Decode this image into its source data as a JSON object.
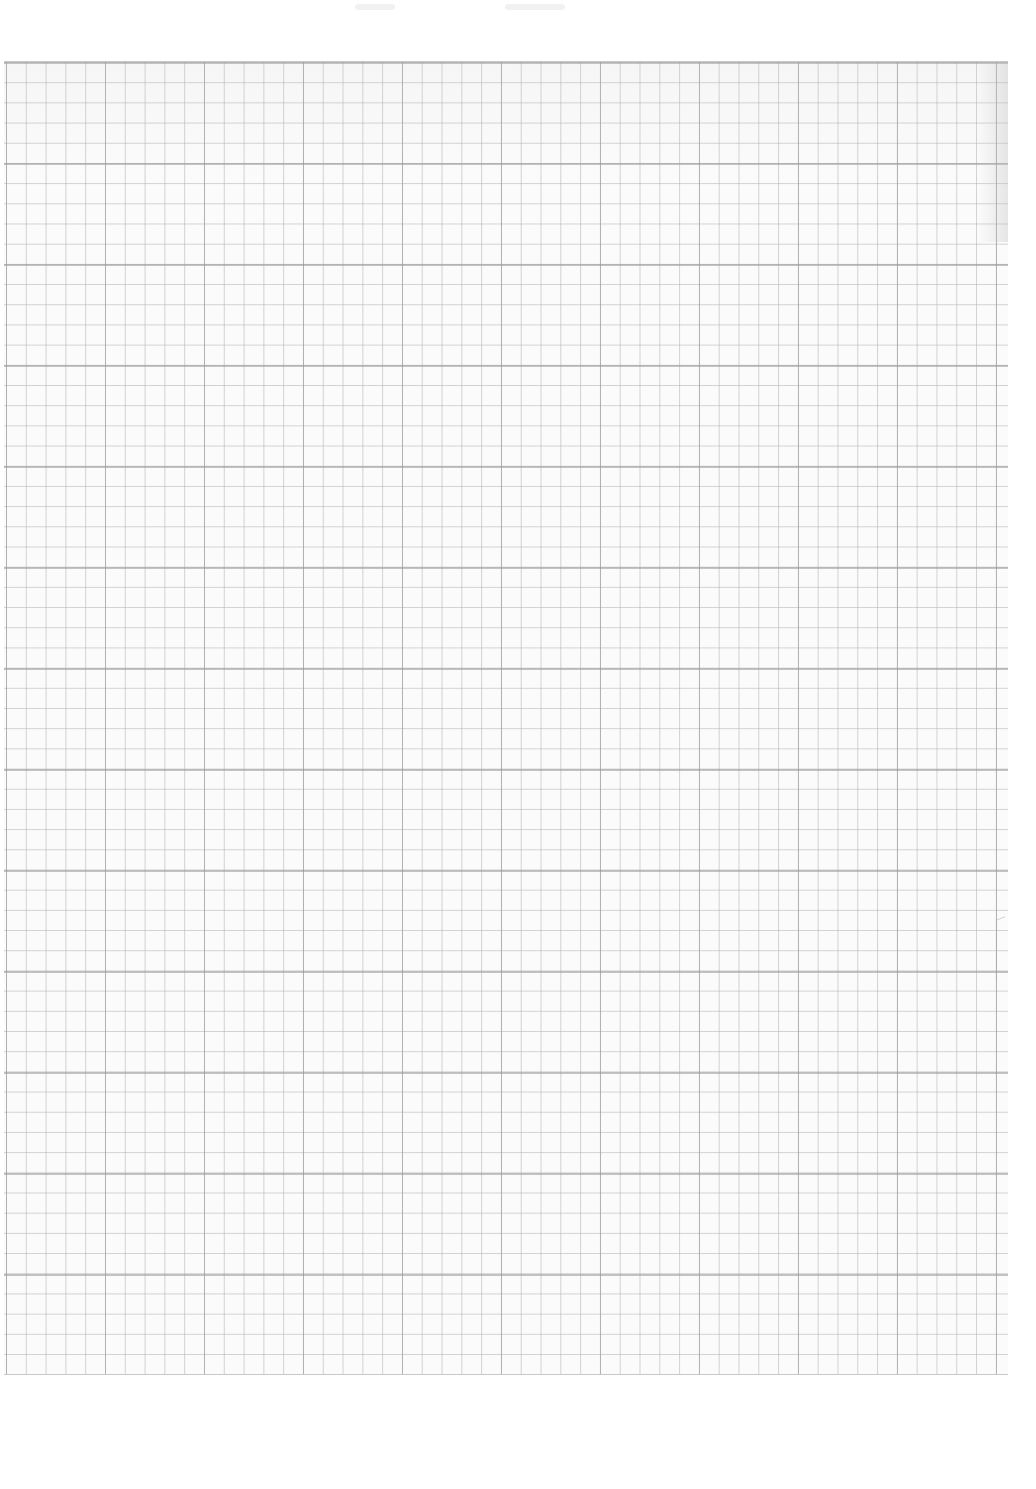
{
  "page": {
    "description": "Scanned sheet of blank graph paper",
    "grid": {
      "minor_cell_px": 20,
      "major_every_cells": 5,
      "line_color": "#a8a8a8",
      "background_color": "#fbfbfb"
    },
    "text": ""
  }
}
